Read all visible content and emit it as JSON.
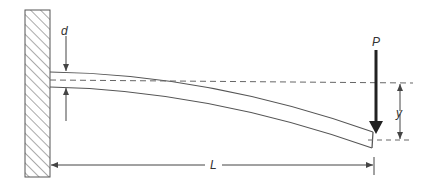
{
  "diagram": {
    "labels": {
      "depth": "d",
      "load": "P",
      "deflection": "y",
      "length": "L"
    },
    "colors": {
      "line": "#555555",
      "load_arrow": "#222222",
      "background": "#ffffff"
    }
  }
}
